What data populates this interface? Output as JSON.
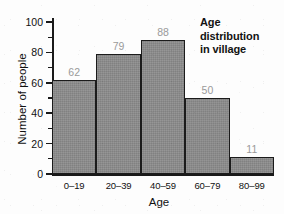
{
  "chart_data": {
    "type": "bar",
    "title": "Age distribution in village",
    "title_lines": [
      "Age",
      "distribution",
      "in village"
    ],
    "xlabel": "Age",
    "ylabel": "Number of people",
    "categories": [
      "0–19",
      "20–39",
      "40–59",
      "60–79",
      "80–99"
    ],
    "values": [
      62,
      79,
      88,
      50,
      11
    ],
    "value_labels": [
      "62",
      "79",
      "88",
      "50",
      "11"
    ],
    "ylim": [
      0,
      100
    ],
    "ytick_major": [
      "0",
      "20",
      "40",
      "60",
      "80",
      "100"
    ],
    "ytick_major_values": [
      0,
      20,
      40,
      60,
      80,
      100
    ],
    "ytick_minor_values": [
      10,
      30,
      50,
      70,
      90
    ],
    "grid": false,
    "legend": false,
    "bar_fill_color": "#8c8c8c",
    "bar_border_color": "#1b1b1b",
    "value_label_color": "#9a9a9a",
    "axis_color": "#1a1a1a",
    "text_color": "#111111",
    "background_color": "#fdfdfd"
  }
}
